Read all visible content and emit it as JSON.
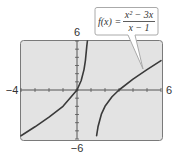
{
  "chart_data": {
    "type": "line",
    "title": "",
    "function_label": {
      "lhs": "f(x) =",
      "numerator": "x² − 3x",
      "denominator": "x − 1",
      "expression": "f(x) = (x^2 - 3x)/(x - 1)"
    },
    "xlabel": "",
    "ylabel": "",
    "xlim": [
      -4,
      6
    ],
    "ylim": [
      -6,
      6
    ],
    "tick_labels": {
      "x_min": "−4",
      "x_max": "6",
      "y_max": "6",
      "y_min": "−6"
    },
    "x_ticks": [
      -4,
      -3,
      -2,
      -1,
      0,
      1,
      2,
      3,
      4,
      5,
      6
    ],
    "y_ticks": [
      -6,
      -5,
      -4,
      -3,
      -2,
      -1,
      0,
      1,
      2,
      3,
      4,
      5,
      6
    ],
    "grid": false,
    "vertical_asymptote": 1,
    "series": [
      {
        "name": "left branch",
        "x": [
          -4,
          -3,
          -2,
          -1,
          0,
          0.3,
          0.5,
          0.6,
          0.7,
          0.74
        ],
        "y": [
          -5.6,
          -4.5,
          -3.33,
          -2,
          0,
          1.16,
          2.5,
          3.6,
          5.37,
          6.41
        ]
      },
      {
        "name": "right branch",
        "x": [
          1.4,
          1.5,
          1.75,
          2,
          2.5,
          3,
          4,
          5,
          6
        ],
        "y": [
          -5.6,
          -4.5,
          -2.92,
          -2,
          -0.83,
          0,
          1.33,
          2.5,
          3.6
        ]
      }
    ],
    "colors": {
      "screen_background": "#e3e3e3",
      "screen_border": "#7a7a7a",
      "curve": "#3a3a3a",
      "axes": "#555555",
      "callout_border": "#aaaaaa",
      "callout_fill": "#ffffff"
    }
  }
}
